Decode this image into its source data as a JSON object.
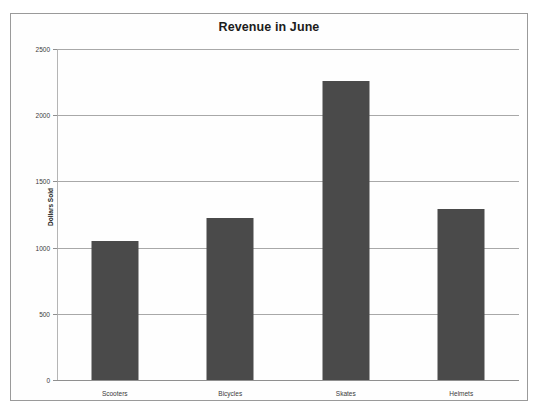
{
  "chart_data": {
    "type": "bar",
    "title": "Revenue in June",
    "xlabel": "",
    "ylabel": "Dollars Sold",
    "categories": [
      "Scooters",
      "Bicycles",
      "Skates",
      "Helmets"
    ],
    "values": [
      1050,
      1220,
      2255,
      1290
    ],
    "ylim": [
      0,
      2500
    ],
    "yticks": [
      0,
      500,
      1000,
      1500,
      2000,
      2500
    ],
    "ytick_labels": [
      "0",
      "500",
      "1000",
      "1500",
      "2000",
      "2500"
    ],
    "grid": true,
    "legend": false,
    "series": [
      {
        "name": "Dollars Sold",
        "color": "#4a4a4a",
        "values": [
          1050,
          1220,
          2255,
          1290
        ]
      }
    ]
  },
  "colors": {
    "bar": "#4a4a4a",
    "gridline": "#a8a8a8",
    "frame_border": "#9a9a9a",
    "background": "#ffffff",
    "text": "#1c1c1c"
  }
}
